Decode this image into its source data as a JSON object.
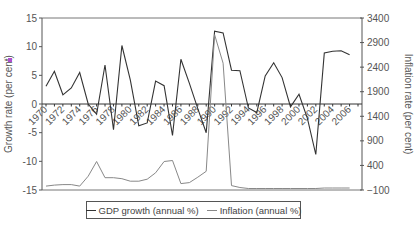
{
  "chart_data": {
    "type": "line",
    "title": "",
    "xlabel": "",
    "ylabel": "Growth rate (per cent)",
    "ylabel_right": "Inflation rate (per cent)",
    "ylim": [
      -15,
      15
    ],
    "ylim_right": [
      -100,
      3400
    ],
    "yticks": [
      15,
      10,
      5,
      0,
      -5,
      -10,
      -15
    ],
    "yticks_right": [
      3400,
      2900,
      2400,
      1900,
      1400,
      900,
      400,
      -100
    ],
    "xtick_labels": [
      "1970",
      "1972",
      "1974",
      "1976",
      "1978",
      "1980",
      "1982",
      "1984",
      "1986",
      "1988",
      "1990",
      "1992",
      "1994",
      "1996",
      "1998",
      "2000",
      "2002",
      "2004",
      "2006"
    ],
    "grid": false,
    "legend_position": "bottom",
    "x": [
      1970,
      1971,
      1972,
      1973,
      1974,
      1975,
      1976,
      1977,
      1978,
      1979,
      1980,
      1981,
      1982,
      1983,
      1984,
      1985,
      1986,
      1987,
      1988,
      1989,
      1990,
      1991,
      1992,
      1993,
      1994,
      1995,
      1996,
      1997,
      1998,
      1999,
      2000,
      2001,
      2002,
      2003,
      2004,
      2005,
      2006,
      2007
    ],
    "series": [
      {
        "name": "GDP growth (annual %)",
        "axis": "left",
        "color": "#333333",
        "values": [
          3.1,
          5.7,
          1.6,
          2.8,
          5.5,
          0.0,
          -1.8,
          6.8,
          -4.5,
          10.2,
          4.2,
          -3.8,
          -3.3,
          4.0,
          3.2,
          -5.5,
          7.8,
          3.6,
          -0.8,
          -5.0,
          12.7,
          12.4,
          5.9,
          5.8,
          -0.7,
          -1.5,
          4.9,
          7.2,
          4.6,
          -0.5,
          1.7,
          -2.5,
          -8.8,
          8.9,
          9.2,
          9.3,
          8.6,
          null
        ]
      },
      {
        "name": "Inflation (annual %)",
        "axis": "right",
        "color": "#888888",
        "values": [
          -20,
          0,
          10,
          10,
          -20,
          180,
          480,
          150,
          150,
          130,
          80,
          80,
          120,
          250,
          480,
          500,
          30,
          50,
          160,
          280,
          3060,
          2480,
          -10,
          -50,
          -70,
          -70,
          -70,
          -70,
          -70,
          -70,
          -70,
          -70,
          -70,
          -60,
          -60,
          -60,
          -60,
          null
        ]
      }
    ]
  },
  "legend": {
    "gdp_label": "GDP growth (annual %)",
    "inflation_label": "Inflation (annual %)"
  },
  "axes": {
    "left_title": "Growth rate (per cent)",
    "right_title": "Inflation rate (per cent)"
  }
}
